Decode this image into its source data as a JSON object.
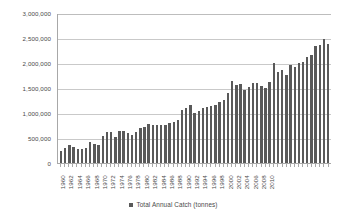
{
  "chart_data": {
    "type": "bar",
    "title": "",
    "xlabel": "",
    "ylabel": "",
    "ylim": [
      0,
      3000000
    ],
    "grid": true,
    "legend_position": "bottom",
    "series": [
      {
        "name": "Total Annual Catch (tonnes)",
        "color": "#595959",
        "values": [
          245000,
          300000,
          355000,
          330000,
          290000,
          280000,
          310000,
          425000,
          385000,
          365000,
          545000,
          630000,
          625000,
          530000,
          640000,
          645000,
          605000,
          565000,
          620000,
          700000,
          730000,
          780000,
          770000,
          755000,
          765000,
          760000,
          800000,
          830000,
          865000,
          1065000,
          1100000,
          1155000,
          1005000,
          1035000,
          1095000,
          1120000,
          1135000,
          1160000,
          1230000,
          1270000,
          1395000,
          1640000,
          1560000,
          1575000,
          1465000,
          1530000,
          1595000,
          1610000,
          1540000,
          1510000,
          1630000,
          1995000,
          1820000,
          1860000,
          1765000,
          1965000,
          1925000,
          2010000,
          2020000,
          2115000,
          2170000,
          2350000,
          2370000,
          2480000,
          2385000
        ]
      }
    ],
    "categories": [
      1960,
      1961,
      1962,
      1963,
      1964,
      1965,
      1966,
      1967,
      1968,
      1969,
      1970,
      1971,
      1972,
      1973,
      1974,
      1975,
      1976,
      1977,
      1978,
      1979,
      1980,
      1981,
      1982,
      1983,
      1984,
      1985,
      1986,
      1987,
      1988,
      1989,
      1990,
      1991,
      1992,
      1993,
      1994,
      1995,
      1996,
      1997,
      1998,
      1999,
      2000,
      2001,
      2002,
      2003,
      2004,
      2005,
      2006,
      2007,
      2008,
      2009,
      2010,
      2011,
      2012,
      2013,
      2014,
      2015,
      2016,
      2017,
      2018,
      2019,
      2020,
      2021,
      2022,
      2023,
      2024
    ],
    "x_tick_labels": [
      "1960",
      "",
      "1962",
      "",
      "1964",
      "",
      "1966",
      "",
      "1968",
      "",
      "1970",
      "",
      "1972",
      "",
      "1974",
      "",
      "1976",
      "",
      "1978",
      "",
      "1980",
      "",
      "1982",
      "",
      "1984",
      "",
      "1986",
      "",
      "1988",
      "",
      "1990",
      "",
      "1992",
      "",
      "1994",
      "",
      "1996",
      "",
      "1998",
      "",
      "2000",
      "",
      "2002",
      "",
      "2004",
      "",
      "2006",
      "",
      "2008",
      "",
      "2010",
      "",
      "",
      "",
      "",
      "",
      "",
      "",
      "",
      "",
      "",
      "",
      "",
      "",
      ""
    ],
    "y_tick_labels": [
      "0",
      "500,000",
      "1,000,000",
      "1,500,000",
      "2,000,000",
      "2,500,000",
      "3,000,000"
    ],
    "y_tick_values": [
      0,
      500000,
      1000000,
      1500000,
      2000000,
      2500000,
      3000000
    ]
  },
  "legend": {
    "label": "Total Annual Catch (tonnes)",
    "swatch_color": "#595959"
  },
  "axis": {
    "line_color": "#a8a8a8",
    "grid_color": "#c9c9c9"
  }
}
